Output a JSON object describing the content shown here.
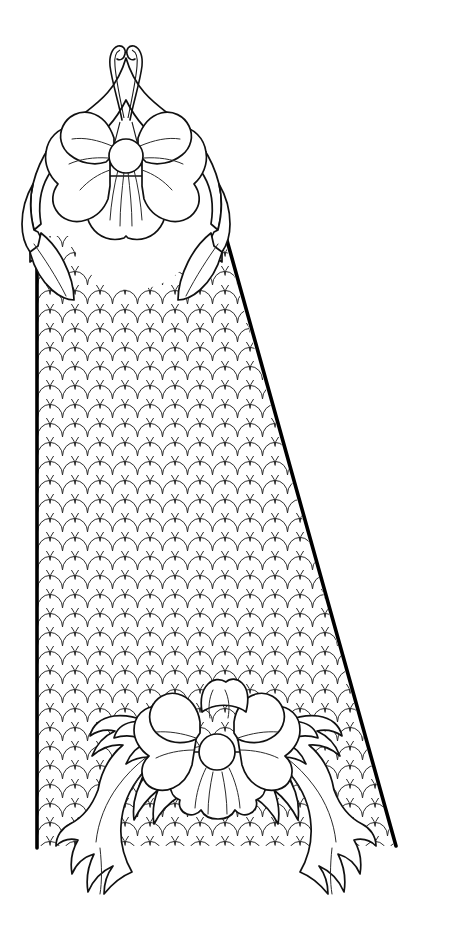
{
  "artwork": {
    "title": "Ornamental Scale-Field Panel with Floral Terminals",
    "kind": "line-art-illustration",
    "style": "black-and-white coloring-book outline",
    "canvas": {
      "width": 453,
      "height": 942,
      "background": "#ffffff"
    },
    "palette": {
      "background": "#ffffff",
      "outline_heavy": "#000000",
      "outline_medium": "#111111",
      "outline_light": "#2b2b2b",
      "fill": "#ffffff"
    },
    "description": "A tall tapering keystone-like panel filled with an overlapping fish-scale (seigaiha) pattern, capped at the apex by a large five-petal blossom with foliate wings, and closed at the base by a second blossom flanked by symmetric acanthus scroll leaves."
  },
  "components": {
    "panel": {
      "label": "scale-field panel",
      "left_edge_x": 36,
      "right_edge_top_x": 222,
      "right_edge_bottom_x": 396,
      "top_y": 214,
      "bottom_y": 848,
      "edge_stroke": "#000000",
      "edge_width_px": 3.6
    },
    "scale_pattern": {
      "label": "fish-scale fill",
      "motif": "seigaiha",
      "cell_width_px": 25,
      "row_pitch_px": 19,
      "arc_radius_px": 12.5,
      "stroke": "#2b2b2b",
      "stroke_width_px": 1.0,
      "rows": 34,
      "columns": 16
    },
    "top_ornament": {
      "label": "apex blossom crown",
      "center_x": 126,
      "center_y": 152,
      "petal_count": 5,
      "core_radius_px": 17,
      "has_tendrils": true,
      "tendril_count": 2,
      "tendril_apex_y": 46,
      "wing_leaf_count": 2
    },
    "bottom_ornament": {
      "label": "base blossom with acanthus scrolls",
      "center_x": 216,
      "center_y": 751,
      "petal_count": 5,
      "core_radius_px": 18,
      "scroll_leaf_pairs": 3,
      "left_scroll_tip": {
        "x": 78,
        "y": 888
      },
      "right_scroll_tip": {
        "x": 360,
        "y": 888
      }
    }
  },
  "labels": {
    "top_ornament": "apex blossom",
    "bottom_ornament": "base blossom",
    "panel": "scale field",
    "left_edge": "left panel edge",
    "right_edge": "right panel edge",
    "tendrils": "apex tendrils",
    "left_scroll": "left acanthus scroll",
    "right_scroll": "right acanthus scroll"
  }
}
